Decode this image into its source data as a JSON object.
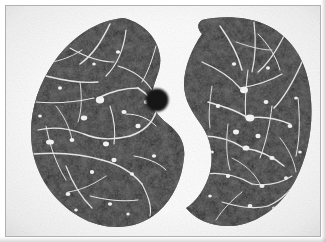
{
  "image": {
    "modality": "CT",
    "body_region": "chest",
    "view": "axial",
    "title": "Axial chest CT slice showing both lungs",
    "background_color": "#fdfdfd",
    "frame_color": "#b0b0b0",
    "frame_inset_px": 5,
    "width_px": 326,
    "height_px": 242
  },
  "regions": [
    {
      "name": "left-lung",
      "label": "Left lung field",
      "side": "image-left",
      "fill_color": "#1b1b1b",
      "center": {
        "x": 80,
        "y": 122
      },
      "notes": "Large convex lung field with mottled low-attenuation parenchyma and bright branching vessels"
    },
    {
      "name": "right-lung",
      "label": "Right lung field",
      "side": "image-right",
      "fill_color": "#1b1b1b",
      "center": {
        "x": 238,
        "y": 122
      },
      "notes": "Crescent shaped lung field with deep medial concavity at the mediastinum"
    },
    {
      "name": "mediastinum",
      "label": "Mediastinal window",
      "fill_color": "#f7f7f7",
      "center": {
        "x": 168,
        "y": 120
      },
      "notes": "Bright soft-tissue gap separating the two lung fields"
    },
    {
      "name": "dark-nodule",
      "label": "Round hypodense structure",
      "fill_color": "#141414",
      "center": {
        "x": 156,
        "y": 99
      },
      "radius_x": 11,
      "radius_y": 11,
      "notes": "Well circumscribed dark round structure within the mediastinal fat"
    }
  ],
  "tissue_tones": {
    "parenchyma_dark": "#151515",
    "parenchyma_mid": "#2c2c2c",
    "parenchyma_light": "#4a4a4a",
    "vessel_white": "#f2f2f2",
    "vessel_bright": "#ffffff",
    "air_gap": "#f8f8f8"
  },
  "annotations": {
    "text_labels": [],
    "scale_bar": null,
    "patient_markers": []
  }
}
